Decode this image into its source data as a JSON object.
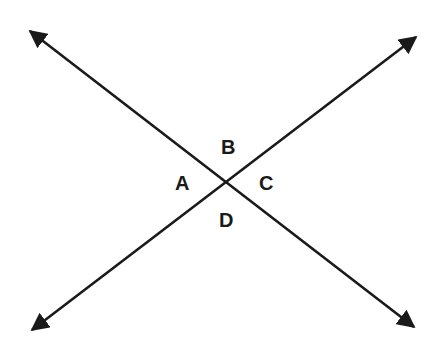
{
  "diagram": {
    "type": "intersecting-lines",
    "line_color": "#1a1a1a",
    "intersection": {
      "x": 225,
      "y": 182
    },
    "lines": [
      {
        "name": "line-1",
        "from": {
          "x": 30,
          "y": 31
        },
        "to": {
          "x": 414,
          "y": 327
        },
        "arrows": "both"
      },
      {
        "name": "line-2",
        "from": {
          "x": 32,
          "y": 330
        },
        "to": {
          "x": 416,
          "y": 37
        },
        "arrows": "both"
      }
    ],
    "angle_labels": [
      {
        "label": "A",
        "position": "left"
      },
      {
        "label": "B",
        "position": "top"
      },
      {
        "label": "C",
        "position": "right"
      },
      {
        "label": "D",
        "position": "bottom"
      }
    ]
  }
}
